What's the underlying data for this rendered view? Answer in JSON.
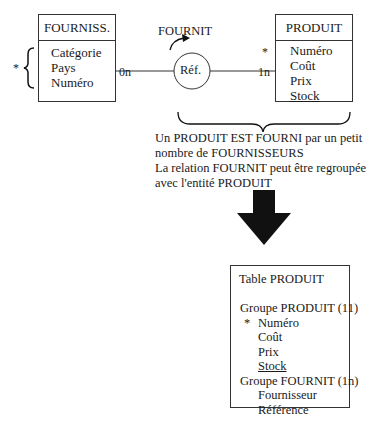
{
  "entities": {
    "fourniss": {
      "title": "FOURNISS.",
      "attributes": [
        "Catégorie",
        "Pays",
        "Numéro"
      ],
      "key_marker": "*"
    },
    "produit": {
      "title": "PRODUIT",
      "attributes": [
        "Numéro",
        "Coût",
        "Prix",
        "Stock"
      ],
      "underlined_attribute": "Stock"
    }
  },
  "relation": {
    "name": "FOURNIT",
    "attribute": "Réf.",
    "cardinality_left": "0n",
    "cardinality_right": "1n",
    "right_marker": "*"
  },
  "description": {
    "lines": [
      "Un PRODUIT EST FOURNI par un petit",
      "nombre de FOURNISSEURS",
      "La relation FOURNIT peut être regroupée",
      "avec l'entité PRODUIT"
    ]
  },
  "table": {
    "title": "Table PRODUIT",
    "group1": {
      "label": "Groupe PRODUIT (11)",
      "key_marker": "*",
      "fields": [
        "Numéro",
        "Coût",
        "Prix",
        "Stock"
      ]
    },
    "group2": {
      "label": "Groupe FOURNIT (1n)",
      "fields": [
        "Fournisseur",
        "Référence"
      ]
    }
  },
  "colors": {
    "line": "#333333",
    "arrow": "#111111",
    "text": "#1a1a1a"
  }
}
